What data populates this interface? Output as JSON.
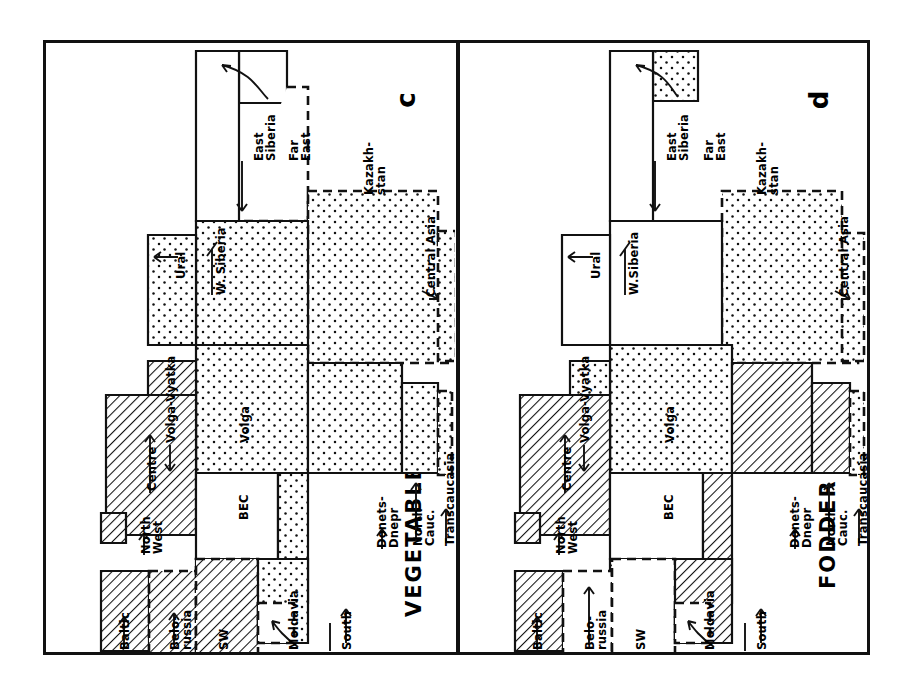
{
  "figure": {
    "kind": "cartogram-pair",
    "background_color": "#ffffff",
    "ink_color": "#111111"
  },
  "legend_patterns": {
    "hatch": "diagonal-hatching",
    "dots": "stippled-dots",
    "blank": "white-unfilled",
    "solid_border": "solid-outline",
    "dashed_border": "dashed-outline"
  },
  "panels": [
    {
      "id": "c",
      "letter": "c",
      "title": "VEGETABLES",
      "labels": [
        {
          "name": "east-siberia",
          "text": "East\nSiberia",
          "x": 208,
          "y": 118,
          "arrow": "right"
        },
        {
          "name": "far-east",
          "text": "Far\nEast",
          "x": 243,
          "y": 118,
          "arrow": "curve"
        },
        {
          "name": "kazakhstan",
          "text": "Kazakh-\nstan",
          "x": 318,
          "y": 152,
          "arrow": "none"
        },
        {
          "name": "w-siberia",
          "text": "W. Siberia",
          "x": 170,
          "y": 252,
          "arrow": "right"
        },
        {
          "name": "ural",
          "text": "Ural",
          "x": 130,
          "y": 236,
          "arrow": "down"
        },
        {
          "name": "central-asia",
          "text": "Central Asia",
          "x": 380,
          "y": 254,
          "arrow": "left"
        },
        {
          "name": "volga-vyatka",
          "text": "Volga-Vyatka",
          "x": 120,
          "y": 400,
          "arrow": "right"
        },
        {
          "name": "volga",
          "text": "Volga",
          "x": 194,
          "y": 400,
          "arrow": "none"
        },
        {
          "name": "centre",
          "text": "Centre",
          "x": 101,
          "y": 448,
          "arrow": "right"
        },
        {
          "name": "bec",
          "text": "BEC",
          "x": 193,
          "y": 477,
          "arrow": "none"
        },
        {
          "name": "north-west",
          "text": "North\nWest",
          "x": 95,
          "y": 511,
          "arrow": "right"
        },
        {
          "name": "donets-dnepr",
          "text": "Donets-\nDnepr",
          "x": 331,
          "y": 505,
          "arrow": "left"
        },
        {
          "name": "north-cauc",
          "text": "North\nCauc.",
          "x": 367,
          "y": 503,
          "arrow": "up"
        },
        {
          "name": "transcaucasia",
          "text": "Transcaucasia",
          "x": 399,
          "y": 503,
          "arrow": "left"
        },
        {
          "name": "baltic",
          "text": "Baltic",
          "x": 74,
          "y": 607,
          "arrow": "right"
        },
        {
          "name": "belorussia",
          "text": "Belo-\nrussia",
          "x": 124,
          "y": 607,
          "arrow": "up"
        },
        {
          "name": "sw",
          "text": "SW",
          "x": 173,
          "y": 607,
          "arrow": "none"
        },
        {
          "name": "moldavia",
          "text": "Moldavia",
          "x": 243,
          "y": 607,
          "arrow": "curve"
        },
        {
          "name": "south",
          "text": "South",
          "x": 296,
          "y": 607,
          "arrow": "up"
        }
      ]
    },
    {
      "id": "d",
      "letter": "d",
      "title": "FODDER",
      "labels": [
        {
          "name": "east-siberia",
          "text": "East\nSiberia",
          "x": 207,
          "y": 118,
          "arrow": "right"
        },
        {
          "name": "far-east",
          "text": "Far\nEast",
          "x": 244,
          "y": 118,
          "arrow": "curve"
        },
        {
          "name": "kazakhstan",
          "text": "Kazakh-\nstan",
          "x": 297,
          "y": 152,
          "arrow": "none"
        },
        {
          "name": "w-siberia",
          "text": "W.Siberia",
          "x": 169,
          "y": 252,
          "arrow": "right"
        },
        {
          "name": "ural",
          "text": "Ural",
          "x": 131,
          "y": 236,
          "arrow": "down"
        },
        {
          "name": "central-asia",
          "text": "Central Asia",
          "x": 379,
          "y": 254,
          "arrow": "left"
        },
        {
          "name": "volga-vyatka",
          "text": "Volga-Vyatka",
          "x": 120,
          "y": 400,
          "arrow": "right"
        },
        {
          "name": "volga",
          "text": "Volga",
          "x": 205,
          "y": 400,
          "arrow": "none"
        },
        {
          "name": "centre",
          "text": "Centre",
          "x": 102,
          "y": 448,
          "arrow": "right"
        },
        {
          "name": "bec",
          "text": "BEC",
          "x": 204,
          "y": 477,
          "arrow": "none"
        },
        {
          "name": "north-west",
          "text": "North\nWest",
          "x": 96,
          "y": 511,
          "arrow": "right"
        },
        {
          "name": "donets-dnepr",
          "text": "Donets-\nDnepr",
          "x": 330,
          "y": 505,
          "arrow": "left"
        },
        {
          "name": "north-cauc",
          "text": "North\nCauc.",
          "x": 366,
          "y": 503,
          "arrow": "up"
        },
        {
          "name": "transcaucasia",
          "text": "Transcaucasia",
          "x": 398,
          "y": 503,
          "arrow": "left"
        },
        {
          "name": "baltic",
          "text": "Baltic",
          "x": 73,
          "y": 607,
          "arrow": "right"
        },
        {
          "name": "belorussia",
          "text": "Belo-\nrussia",
          "x": 125,
          "y": 607,
          "arrow": "up"
        },
        {
          "name": "sw",
          "text": "SW",
          "x": 176,
          "y": 607,
          "arrow": "none"
        },
        {
          "name": "moldavia",
          "text": "Moldavia",
          "x": 245,
          "y": 607,
          "arrow": "curve"
        },
        {
          "name": "south",
          "text": "South",
          "x": 297,
          "y": 607,
          "arrow": "up"
        }
      ]
    }
  ],
  "regions_c": [
    {
      "name": "far-east",
      "fill": "blank",
      "border": "solid",
      "d": "M193 8 L241 8 L241 60 L193 60 Z"
    },
    {
      "name": "far-east-dash",
      "fill": "blank",
      "border": "dashed",
      "d": "M241 44 L262 44 L262 178 L193 178"
    },
    {
      "name": "east-siberia",
      "fill": "blank",
      "border": "solid",
      "d": "M193 8 L193 178 L150 178 L150 8 Z"
    },
    {
      "name": "kazakhstan",
      "fill": "dots",
      "border": "dashed",
      "d": "M262 148 L392 148 L392 202 L404 202 L404 320 L262 320 Z"
    },
    {
      "name": "central-asia",
      "fill": "dots",
      "border": "dashed",
      "d": "M392 188 L410 188 L410 318 L392 318 Z"
    },
    {
      "name": "w-siberia",
      "fill": "dots",
      "border": "solid",
      "d": "M150 178 L262 178 L262 302 L150 302 Z"
    },
    {
      "name": "ural",
      "fill": "dots",
      "border": "solid",
      "d": "M102 192 L150 192 L150 302 L102 302 Z"
    },
    {
      "name": "volga",
      "fill": "dots",
      "border": "solid",
      "d": "M150 302 L262 302 L262 430 L150 430 Z"
    },
    {
      "name": "volga-vyatka",
      "fill": "hatch",
      "border": "solid",
      "d": "M102 318 L150 318 L150 430 L102 430 Z"
    },
    {
      "name": "centre",
      "fill": "hatch",
      "border": "solid",
      "d": "M60 352 L150 352 L150 492 L60 492 Z"
    },
    {
      "name": "bec",
      "fill": "blank",
      "border": "solid",
      "d": "M150 430 L232 430 L232 516 L150 516 Z"
    },
    {
      "name": "north-west",
      "fill": "hatch",
      "border": "solid",
      "d": "M55 470 L80 470 L80 500 L55 500 Z"
    },
    {
      "name": "donets-dnepr",
      "fill": "dots",
      "border": "solid",
      "d": "M262 320 L356 320 L356 430 L232 430 L232 516 L150 516 L150 560 L262 560 Z"
    },
    {
      "name": "north-cauc",
      "fill": "dots",
      "border": "solid",
      "d": "M356 340 L392 340 L392 430 L356 430 Z"
    },
    {
      "name": "transcaucasia",
      "fill": "dots",
      "border": "dashed",
      "d": "M392 348 L406 348 L406 432 L392 432 Z"
    },
    {
      "name": "baltic",
      "fill": "hatch",
      "border": "solid",
      "d": "M55 528 L103 528 L103 608 L55 608 Z"
    },
    {
      "name": "belorussia",
      "fill": "hatch",
      "border": "dashed",
      "d": "M103 528 L150 528 L150 612 L103 612 Z"
    },
    {
      "name": "sw",
      "fill": "hatch",
      "border": "dashed",
      "d": "M150 516 L212 516 L212 612 L150 612 Z"
    },
    {
      "name": "south",
      "fill": "dots",
      "border": "solid",
      "d": "M212 516 L262 516 L262 600 L212 600 Z"
    },
    {
      "name": "moldavia",
      "fill": "blank",
      "border": "dashed",
      "d": "M212 560 L248 560 L248 600 L212 600 Z"
    }
  ],
  "regions_d": [
    {
      "name": "far-east",
      "fill": "dots",
      "border": "solid",
      "d": "M193 8 L238 8 L238 58 L193 58 Z"
    },
    {
      "name": "east-siberia",
      "fill": "blank",
      "border": "solid",
      "d": "M193 8 L193 178 L150 178 L150 8 Z"
    },
    {
      "name": "kazakhstan",
      "fill": "dots",
      "border": "dashed",
      "d": "M262 148 L382 148 L382 200 L398 200 L398 320 L262 320 Z"
    },
    {
      "name": "central-asia",
      "fill": "dots",
      "border": "dashed",
      "d": "M382 190 L404 190 L404 318 L382 318 Z"
    },
    {
      "name": "w-siberia",
      "fill": "blank",
      "border": "solid",
      "d": "M150 178 L262 178 L262 302 L150 302 Z"
    },
    {
      "name": "ural",
      "fill": "blank",
      "border": "solid",
      "d": "M102 192 L150 192 L150 302 L102 302 Z"
    },
    {
      "name": "volga",
      "fill": "dots",
      "border": "solid",
      "d": "M150 302 L272 302 L272 430 L150 430 Z"
    },
    {
      "name": "volga-vyatka",
      "fill": "dots",
      "border": "solid",
      "d": "M110 318 L150 318 L150 430 L110 430 Z"
    },
    {
      "name": "centre",
      "fill": "hatch",
      "border": "solid",
      "d": "M60 352 L150 352 L150 492 L60 492 Z"
    },
    {
      "name": "bec",
      "fill": "blank",
      "border": "solid",
      "d": "M150 430 L243 430 L243 516 L150 516 Z"
    },
    {
      "name": "north-west",
      "fill": "hatch",
      "border": "solid",
      "d": "M55 470 L80 470 L80 500 L55 500 Z"
    },
    {
      "name": "donets-dnepr",
      "fill": "hatch",
      "border": "solid",
      "d": "M272 320 L352 320 L352 430 L243 430 L243 516 L150 516 L150 560 L272 560 Z"
    },
    {
      "name": "north-cauc",
      "fill": "hatch",
      "border": "solid",
      "d": "M352 340 L390 340 L390 430 L352 430 Z"
    },
    {
      "name": "transcaucasia",
      "fill": "dots",
      "border": "dashed",
      "d": "M390 348 L404 348 L404 432 L390 432 Z"
    },
    {
      "name": "baltic",
      "fill": "hatch",
      "border": "solid",
      "d": "M55 528 L103 528 L103 608 L55 608 Z"
    },
    {
      "name": "belorussia",
      "fill": "blank",
      "border": "dashed",
      "d": "M103 528 L152 528 L152 612 L103 612 Z"
    },
    {
      "name": "sw",
      "fill": "blank",
      "border": "dashed",
      "d": "M152 516 L215 516 L215 612 L152 612 Z"
    },
    {
      "name": "south",
      "fill": "hatch",
      "border": "solid",
      "d": "M215 516 L272 516 L272 600 L215 600 Z"
    },
    {
      "name": "moldavia",
      "fill": "blank",
      "border": "dashed",
      "d": "M215 560 L250 560 L250 600 L215 600 Z"
    }
  ]
}
